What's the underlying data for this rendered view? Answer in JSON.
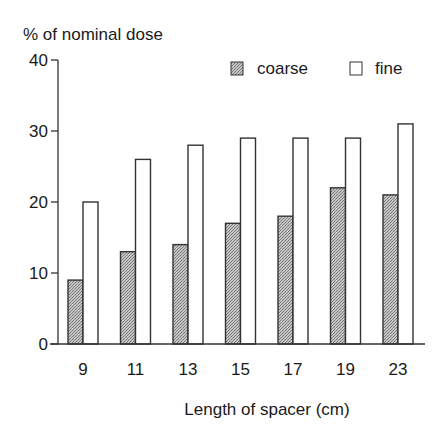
{
  "chart_data": {
    "type": "bar",
    "title": "",
    "ylabel": "% of nominal dose",
    "xlabel": "Length of spacer  (cm)",
    "categories": [
      "9",
      "11",
      "13",
      "15",
      "17",
      "19",
      "23"
    ],
    "series": [
      {
        "name": "coarse",
        "values": [
          9,
          13,
          14,
          17,
          18,
          22,
          21
        ],
        "fill": "#a8a8a8"
      },
      {
        "name": "fine",
        "values": [
          20,
          26,
          28,
          29,
          29,
          29,
          31
        ],
        "fill": "#ffffff"
      }
    ],
    "ylim": [
      0,
      40
    ],
    "yticks": [
      0,
      10,
      20,
      30,
      40
    ],
    "grid": false,
    "legend_position": "top-right"
  },
  "colors": {
    "axis": "#333333",
    "coarse": "#a8a8a8",
    "fine": "#ffffff",
    "bar_edge": "#333333"
  }
}
